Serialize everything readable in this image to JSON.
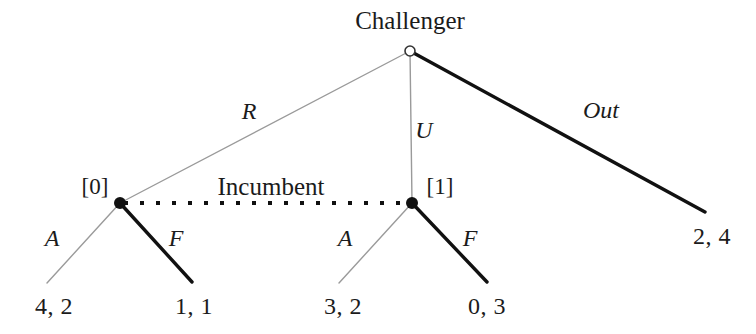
{
  "figure": {
    "kind": "extensive-form-game-tree",
    "background_color": "#ffffff",
    "colors": {
      "equilibrium_path": "#111111",
      "off_path": "#9a9a9a",
      "node_fill": "#111111",
      "root_node_stroke": "#333333",
      "text": "#1b1b1b",
      "information_set": "#111111"
    }
  },
  "players": {
    "root_player": "Challenger",
    "information_set_player": "Incumbent"
  },
  "nodes": {
    "root": {
      "id": "root",
      "x": 410,
      "y": 51,
      "type": "open-circle",
      "radius": 5
    },
    "left": {
      "id": "left",
      "x": 120,
      "y": 203,
      "type": "filled-dot",
      "radius": 6,
      "index_label": "[0]"
    },
    "right": {
      "id": "right",
      "x": 412,
      "y": 203,
      "type": "filled-dot",
      "radius": 6,
      "index_label": "[1]"
    }
  },
  "edges": [
    {
      "name": "root-to-left",
      "label": "R",
      "from": [
        410,
        51
      ],
      "to": [
        120,
        203
      ],
      "style": "thin",
      "color": "#9a9a9a",
      "width": 1.4
    },
    {
      "name": "root-to-right",
      "label": "U",
      "from": [
        410,
        51
      ],
      "to": [
        412,
        203
      ],
      "style": "thin",
      "color": "#9a9a9a",
      "width": 1.4
    },
    {
      "name": "root-to-out",
      "label": "Out",
      "from": [
        410,
        51
      ],
      "to": [
        705,
        212
      ],
      "style": "thick",
      "color": "#111111",
      "width": 3.4
    },
    {
      "name": "left-to-A",
      "label": "A",
      "from": [
        120,
        203
      ],
      "to": [
        47,
        283
      ],
      "style": "thin",
      "color": "#9a9a9a",
      "width": 1.4
    },
    {
      "name": "left-to-F",
      "label": "F",
      "from": [
        120,
        203
      ],
      "to": [
        192,
        282
      ],
      "style": "thick",
      "color": "#111111",
      "width": 3.4
    },
    {
      "name": "right-to-A",
      "label": "A",
      "from": [
        412,
        203
      ],
      "to": [
        339,
        283
      ],
      "style": "thin",
      "color": "#9a9a9a",
      "width": 1.4
    },
    {
      "name": "right-to-F",
      "label": "F",
      "from": [
        412,
        203
      ],
      "to": [
        487,
        282
      ],
      "style": "thick",
      "color": "#111111",
      "width": 3.4
    }
  ],
  "information_set": {
    "label": "Incumbent",
    "label_x": 271,
    "label_y": 186,
    "from": [
      126,
      203
    ],
    "to": [
      406,
      203
    ],
    "style": "dotted",
    "dot_size": 4,
    "dot_gap": 12,
    "color": "#111111"
  },
  "edge_labels": {
    "r": {
      "text": "R",
      "x": 249,
      "y": 111
    },
    "u": {
      "text": "U",
      "x": 424,
      "y": 130
    },
    "out": {
      "text": "Out",
      "x": 601,
      "y": 110
    },
    "left_a": {
      "text": "A",
      "x": 52,
      "y": 238
    },
    "left_f": {
      "text": "F",
      "x": 176,
      "y": 238
    },
    "right_a": {
      "text": "A",
      "x": 345,
      "y": 238
    },
    "right_f": {
      "text": "F",
      "x": 470,
      "y": 238
    }
  },
  "node_labels": {
    "root_title": {
      "text": "Challenger",
      "x": 410,
      "y": 20
    },
    "left_index": {
      "text": "[0]",
      "x": 95,
      "y": 186
    },
    "right_index": {
      "text": "[1]",
      "x": 440,
      "y": 186
    }
  },
  "payoffs": [
    {
      "name": "payoff-R-A",
      "text": "4, 2",
      "x": 54,
      "y": 306,
      "challenger": 4,
      "incumbent": 2
    },
    {
      "name": "payoff-R-F",
      "text": "1, 1",
      "x": 194,
      "y": 306,
      "challenger": 1,
      "incumbent": 1
    },
    {
      "name": "payoff-U-A",
      "text": "3, 2",
      "x": 343,
      "y": 306,
      "challenger": 3,
      "incumbent": 2
    },
    {
      "name": "payoff-U-F",
      "text": "0, 3",
      "x": 487,
      "y": 306,
      "challenger": 0,
      "incumbent": 3
    },
    {
      "name": "payoff-Out",
      "text": "2, 4",
      "x": 712,
      "y": 236,
      "challenger": 2,
      "incumbent": 4
    }
  ]
}
